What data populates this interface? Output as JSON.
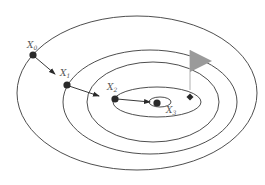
{
  "diagram": {
    "type": "gradient-descent-contour",
    "colors": {
      "contour": "#3a3a3a",
      "point": "#2a2a2a",
      "flag": "#9a9a9a",
      "flag_pole": "#b0b0b0",
      "label": "#555555"
    },
    "contours": [
      {
        "id": "contour-1",
        "cx": 137,
        "cy": 93,
        "rx": 120,
        "ry": 77
      },
      {
        "id": "contour-2",
        "cx": 150,
        "cy": 102,
        "rx": 87,
        "ry": 52
      },
      {
        "id": "contour-3",
        "cx": 153,
        "cy": 102,
        "rx": 66,
        "ry": 40
      },
      {
        "id": "contour-4",
        "cx": 157,
        "cy": 102,
        "rx": 44,
        "ry": 15
      },
      {
        "id": "contour-5",
        "cx": 160,
        "cy": 102,
        "rx": 11,
        "ry": 5
      }
    ],
    "points": [
      {
        "id": "x0",
        "label": "X",
        "sub": "0",
        "x": 33,
        "y": 55
      },
      {
        "id": "x1",
        "label": "X",
        "sub": "1",
        "x": 67,
        "y": 85
      },
      {
        "id": "x2",
        "label": "X",
        "sub": "2",
        "x": 115,
        "y": 99
      },
      {
        "id": "x3",
        "label": "X",
        "sub": "3",
        "x": 157,
        "y": 103
      }
    ],
    "labels": {
      "x0": "X",
      "x0_sub": "0",
      "x1": "X",
      "x1_sub": "1",
      "x2": "X",
      "x2_sub": "2",
      "x3": "X",
      "x3_sub": "3"
    },
    "goal": {
      "flag_pole": {
        "x": 190,
        "y_top": 50,
        "y_bottom": 90
      },
      "flag_triangle": [
        [
          190,
          50
        ],
        [
          212,
          61
        ],
        [
          190,
          72
        ]
      ],
      "marker": {
        "x": 190,
        "y": 97,
        "shape": "diamond"
      }
    }
  }
}
